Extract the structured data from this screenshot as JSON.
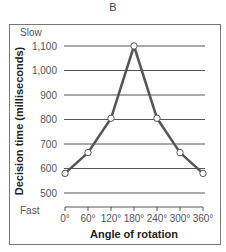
{
  "panel": {
    "label": "B"
  },
  "chart_data": {
    "type": "line",
    "title": "",
    "xlabel": "Angle of rotation",
    "ylabel": "Decision time (milliseconds)",
    "x_ticks": [
      "0°",
      "60°",
      "120°",
      "180°",
      "240°",
      "300°",
      "360°"
    ],
    "y_ticks": [
      "500",
      "600",
      "700",
      "800",
      "900",
      "1,000",
      "1,100"
    ],
    "y_annotations": {
      "top": "Slow",
      "bottom": "Fast"
    },
    "ylim": [
      500,
      1100
    ],
    "xlim": [
      0,
      360
    ],
    "grid": true,
    "series": [
      {
        "name": "Decision time",
        "x": [
          0,
          60,
          120,
          180,
          240,
          300,
          360
        ],
        "values": [
          580,
          665,
          805,
          1100,
          805,
          665,
          580
        ],
        "color": "#555555",
        "marker": "open-circle"
      }
    ]
  }
}
